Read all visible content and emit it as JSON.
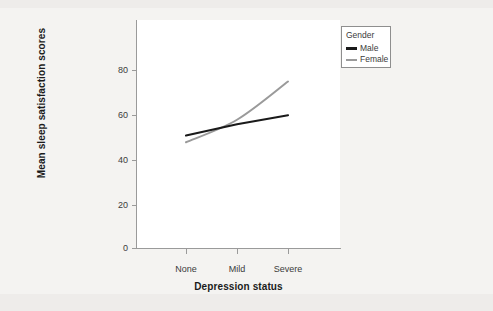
{
  "chart_data": {
    "type": "line",
    "title": "",
    "xlabel": "Depression status",
    "ylabel": "Mean sleep satisfaction scores",
    "categories": [
      "None",
      "Mild",
      "Severe"
    ],
    "series": [
      {
        "name": "Male",
        "values": [
          50,
          55,
          59
        ],
        "color": "#1a1a1a"
      },
      {
        "name": "Female",
        "values": [
          47,
          57,
          74
        ],
        "color": "#9a9a9a"
      }
    ],
    "ylim": [
      0,
      90
    ],
    "yticks": [
      0,
      20,
      40,
      60,
      80
    ],
    "ytick_labels": [
      "0",
      "20",
      "40",
      "60",
      "80"
    ],
    "grid": false,
    "legend": {
      "title": "Gender",
      "position": "top-right",
      "entries": [
        {
          "label": "Male",
          "color": "#1a1a1a"
        },
        {
          "label": "Female",
          "color": "#9a9a9a"
        }
      ]
    }
  },
  "colors": {
    "page_background": "#eeecea",
    "paper": "#f4f3f1",
    "panel": "#ffffff",
    "axis": "#9a9a9a",
    "text": "#3b3b3b",
    "title_text": "#1b1b1b",
    "male": "#1a1a1a",
    "female": "#9a9a9a"
  }
}
